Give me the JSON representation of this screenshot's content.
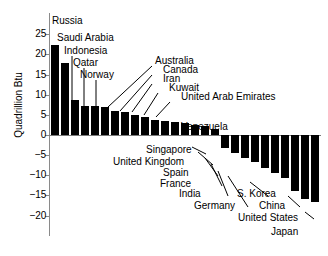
{
  "chart_data": {
    "type": "bar",
    "title": "",
    "xlabel": "",
    "ylabel": "Quadrillion Btu",
    "ylim": [
      -20,
      25
    ],
    "ytick_labels": [
      "25",
      "20",
      "15",
      "10",
      "5",
      "0",
      "−5",
      "−10",
      "−15",
      "−20"
    ],
    "ytick_values": [
      25,
      20,
      15,
      10,
      5,
      0,
      -5,
      -10,
      -15,
      -20
    ],
    "grid": false,
    "legend": "none",
    "categories": [
      "Russia",
      "Saudi Arabia",
      "Indonesia",
      "Qatar",
      "Norway",
      "Australia",
      "Canada",
      "Iran",
      "Kuwait",
      "United Arab Emirates",
      "Venezuela",
      "bar-12",
      "bar-13",
      "bar-14",
      "bar-15",
      "bar-16",
      "bar-17",
      "Singapore",
      "United Kingdom",
      "Spain",
      "France",
      "India",
      "Germany",
      "S. Korea",
      "China",
      "United States",
      "Japan"
    ],
    "values": [
      22.4,
      17.8,
      8.7,
      7.3,
      7.2,
      7.0,
      6.0,
      5.8,
      5.0,
      4.5,
      3.6,
      3.4,
      3.2,
      3.0,
      2.6,
      2.2,
      1.6,
      -3.3,
      -4.5,
      -5.6,
      -6.8,
      -8.3,
      -9.4,
      -10.6,
      -14.0,
      -16.0,
      -16.6
    ],
    "labeled_points": [
      {
        "name": "Russia",
        "value": 22.4
      },
      {
        "name": "Saudi Arabia",
        "value": 17.8
      },
      {
        "name": "Indonesia",
        "value": 8.7
      },
      {
        "name": "Qatar",
        "value": 7.3
      },
      {
        "name": "Norway",
        "value": 7.2
      },
      {
        "name": "Australia",
        "value": 7.0
      },
      {
        "name": "Canada",
        "value": 6.0
      },
      {
        "name": "Iran",
        "value": 5.8
      },
      {
        "name": "Kuwait",
        "value": 5.0
      },
      {
        "name": "United Arab Emirates",
        "value": 4.5
      },
      {
        "name": "Venezuela",
        "value": 3.6
      },
      {
        "name": "Singapore",
        "value": -3.3
      },
      {
        "name": "United Kingdom",
        "value": -4.5
      },
      {
        "name": "Spain",
        "value": -5.6
      },
      {
        "name": "France",
        "value": -6.8
      },
      {
        "name": "India",
        "value": -8.3
      },
      {
        "name": "Germany",
        "value": -9.4
      },
      {
        "name": "S. Korea",
        "value": -10.6
      },
      {
        "name": "China",
        "value": -14.0
      },
      {
        "name": "United States",
        "value": -16.0
      },
      {
        "name": "Japan",
        "value": -16.6
      }
    ],
    "colors": {
      "bar": "#000000",
      "axis": "#8a8a8a",
      "text": "#000000",
      "background": "#ffffff"
    }
  },
  "annotations": {
    "russia": "Russia",
    "saudi_arabia": "Saudi Arabia",
    "indonesia": "Indonesia",
    "qatar": "Qatar",
    "norway": "Norway",
    "australia": "Australia",
    "canada": "Canada",
    "iran": "Iran",
    "kuwait": "Kuwait",
    "uae": "United Arab Emirates",
    "venezuela": "Venezuela",
    "singapore": "Singapore",
    "united_kingdom": "United Kingdom",
    "spain": "Spain",
    "france": "France",
    "india": "India",
    "germany": "Germany",
    "s_korea": "S. Korea",
    "china": "China",
    "united_states": "United States",
    "japan": "Japan"
  },
  "axis": {
    "y_title": "Quadrillion Btu",
    "ticks": [
      "25",
      "20",
      "15",
      "10",
      "5",
      "0",
      "−5",
      "−10",
      "−15",
      "−20"
    ]
  }
}
